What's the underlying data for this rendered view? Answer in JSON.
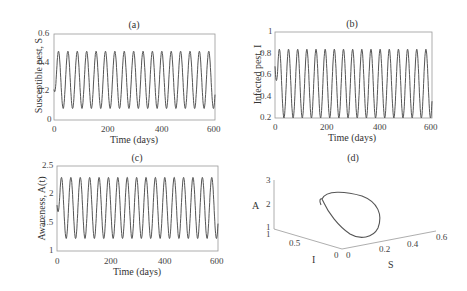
{
  "chart_data": [
    {
      "type": "line",
      "panel": "(a)",
      "title": "(a)",
      "xlabel": "Time (days)",
      "ylabel": "Susceptible pest, S",
      "xlim": [
        0,
        600
      ],
      "ylim": [
        0,
        0.6
      ],
      "xticks": [
        "0",
        "200",
        "400",
        "600"
      ],
      "yticks": [
        "0",
        "0.2",
        "0.4",
        "0.6"
      ],
      "series": [
        {
          "name": "S(t)",
          "min": 0.08,
          "max": 0.48,
          "start": 0.3,
          "peaks": 17,
          "period_days": 35
        }
      ]
    },
    {
      "type": "line",
      "panel": "(b)",
      "title": "(b)",
      "xlabel": "Time (days)",
      "ylabel": "Infected pest, I",
      "xlim": [
        0,
        600
      ],
      "ylim": [
        0.2,
        1
      ],
      "xticks": [
        "0",
        "200",
        "400",
        "600"
      ],
      "yticks": [
        "0.2",
        "0.4",
        "0.6",
        "0.8",
        "1"
      ],
      "series": [
        {
          "name": "I(t)",
          "min": 0.2,
          "max": 0.84,
          "start": 1.0,
          "peaks": 17,
          "period_days": 35
        }
      ]
    },
    {
      "type": "line",
      "panel": "(c)",
      "title": "(c)",
      "xlabel": "Time (days)",
      "ylabel": "Awareness, A(t)",
      "xlim": [
        0,
        600
      ],
      "ylim": [
        1,
        2.5
      ],
      "xticks": [
        "0",
        "200",
        "400",
        "600"
      ],
      "yticks": [
        "1",
        "1.5",
        "2",
        "2.5"
      ],
      "series": [
        {
          "name": "A(t)",
          "min": 1.22,
          "max": 2.3,
          "start": 2.2,
          "peaks": 17,
          "period_days": 35
        }
      ]
    },
    {
      "type": "line3d",
      "panel": "(d)",
      "title": "(d)",
      "xlabel": "S",
      "ylabel": "I",
      "zlabel": "A",
      "xticks": [
        "0",
        "0.2",
        "0.4",
        "0.6"
      ],
      "yticks": [
        "0",
        "0.5",
        "1"
      ],
      "zticks": [
        "1",
        "2",
        "3"
      ],
      "description": "Phase portrait: closed limit cycle in S-I-A space"
    }
  ],
  "panels": {
    "a": {
      "title": "(a)",
      "xlabel": "Time (days)",
      "ylabel": "Susceptible pest, S",
      "xticks": [
        "0",
        "200",
        "400",
        "600"
      ],
      "yticks": [
        "0",
        "0.2",
        "0.4",
        "0.6"
      ]
    },
    "b": {
      "title": "(b)",
      "xlabel": "Time (days)",
      "ylabel": "Infected pest, I",
      "xticks": [
        "0",
        "200",
        "400",
        "600"
      ],
      "yticks": [
        "0.2",
        "0.4",
        "0.6",
        "0.8",
        "1"
      ]
    },
    "c": {
      "title": "(c)",
      "xlabel": "Time (days)",
      "ylabel": "Awareness, A(t)",
      "xticks": [
        "0",
        "200",
        "400",
        "600"
      ],
      "yticks": [
        "1",
        "1.5",
        "2",
        "2.5"
      ]
    },
    "d": {
      "title": "(d)",
      "xlabel": "S",
      "ylabel": "I",
      "zlabel": "A",
      "xticks": [
        "0",
        "0.2",
        "0.4",
        "0.6"
      ],
      "yticks": [
        "0",
        "0.5",
        "1"
      ],
      "zticks": [
        "1",
        "2",
        "3"
      ]
    }
  },
  "colors": {
    "line": "#555555",
    "axis": "#888888",
    "text": "#333333"
  }
}
